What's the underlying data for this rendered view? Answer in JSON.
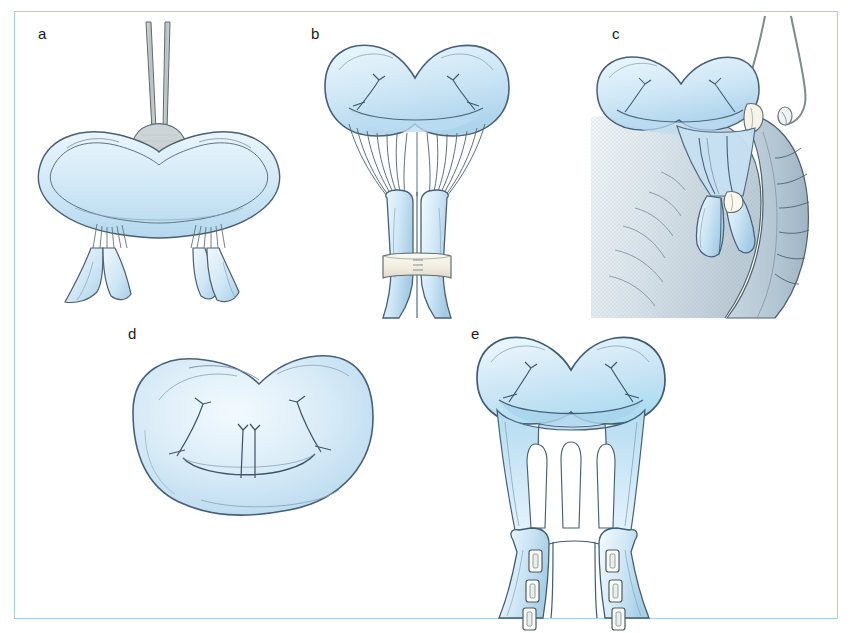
{
  "figure": {
    "kind": "surgical-illustration",
    "frame_border_color": "#a9cfe3",
    "background_color": "#ffffff",
    "ink_color": "#3f5a6b",
    "tissue_fill_light": "#e8f4fb",
    "tissue_fill_mid": "#cbe5f4",
    "tissue_fill_deep": "#a9d2e8",
    "muscle_fill": "#b9c9d4",
    "band_fill": "#f2efe4",
    "instrument_fill": "#c3c9c9"
  },
  "panels": [
    {
      "id": "a",
      "label": "a",
      "label_x": 23,
      "label_y": 24,
      "caption": "Excised mitral valve held with forceps showing native chordae tendineae and paired papillary muscles",
      "elements": {
        "instrument": "forceps",
        "chordae_count": 14,
        "papillary_muscle_groups": 2
      }
    },
    {
      "id": "b",
      "label": "b",
      "label_x": 296,
      "label_y": 24,
      "caption": "Papillary muscles approximated and bound together with an encircling band",
      "elements": {
        "chordae_count": 16,
        "papillary_muscle_groups": 2,
        "band": "encircling suture band"
      }
    },
    {
      "id": "c",
      "label": "c",
      "label_x": 597,
      "label_y": 24,
      "caption": "Valve complex positioned within the left ventricle, secured with pledgeted sutures",
      "elements": {
        "suture_threads": 2,
        "pledgets": 2,
        "ventricle_wall": "left ventricular myocardium"
      }
    },
    {
      "id": "d",
      "label": "d",
      "label_x": 113,
      "label_y": 325,
      "caption": "En-face view of the valve orifice with central coaptation sutures",
      "elements": {
        "coaptation_sutures": 2
      }
    },
    {
      "id": "e",
      "label": "e",
      "label_x": 456,
      "label_y": 325,
      "caption": "Reconstructed valve with fenestrated membranous skirt and pledget-reinforced papillary muscles",
      "elements": {
        "fenestrations": 3,
        "strut_bands": 4,
        "pledgets_per_muscle": 3,
        "papillary_muscle_groups": 2
      }
    }
  ]
}
